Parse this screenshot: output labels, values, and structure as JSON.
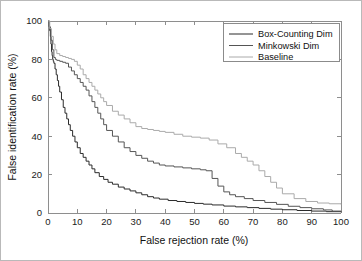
{
  "chart_data": {
    "type": "line",
    "title": "",
    "xlabel": "False rejection rate (%)",
    "ylabel": "False identification rate (%)",
    "xlim": [
      0,
      100
    ],
    "ylim": [
      0,
      100
    ],
    "xticks": [
      0,
      10,
      20,
      30,
      40,
      50,
      60,
      70,
      80,
      90,
      100
    ],
    "yticks": [
      0,
      20,
      40,
      60,
      80,
      100
    ],
    "xticklabels": [
      "0",
      "10",
      "20",
      "30",
      "40",
      "50",
      "60",
      "70",
      "80",
      "90",
      "100"
    ],
    "yticklabels": [
      "0",
      "20",
      "40",
      "60",
      "80",
      "100"
    ],
    "grid": false,
    "legend_position": "upper right",
    "series": [
      {
        "name": "Box-Counting Dim",
        "color": "#2b2b2b",
        "x": [
          0,
          0.4,
          0.8,
          1.0,
          1.2,
          1.4,
          1.6,
          1.8,
          2.0,
          2.4,
          2.8,
          3.2,
          3.6,
          4.0,
          4.6,
          5.2,
          5.8,
          6.4,
          7.0,
          7.6,
          8.4,
          9.2,
          10.0,
          11.0,
          12.0,
          13.0,
          14.0,
          15.0,
          16.0,
          17.5,
          19.0,
          20.5,
          22.0,
          24.0,
          26.0,
          28.0,
          30.0,
          32.0,
          34.0,
          36.0,
          38.0,
          41.0,
          44.0,
          47.0,
          50.0,
          53.0,
          56.0,
          60.0,
          64.0,
          68.0,
          72.0,
          76.0,
          80.0,
          85.0,
          90.0,
          95.0,
          100.0
        ],
        "y": [
          100,
          97,
          92,
          88,
          84,
          82,
          80,
          79,
          78,
          75,
          72,
          69,
          66,
          63,
          59,
          55,
          52,
          49,
          46,
          43,
          40,
          37,
          34,
          31,
          29,
          27,
          25,
          23,
          21,
          19,
          17.5,
          16,
          15,
          13.5,
          12.5,
          11.5,
          10.5,
          9.5,
          8.5,
          7.8,
          7.2,
          6.5,
          6.0,
          5.5,
          5.0,
          4.6,
          4.2,
          3.6,
          3.2,
          2.8,
          2.4,
          2.0,
          1.7,
          1.3,
          1.0,
          0.7,
          0.4
        ]
      },
      {
        "name": "Minkowski Dim",
        "color": "#555555",
        "x": [
          0,
          0.5,
          1.0,
          1.5,
          2.0,
          2.5,
          3.0,
          4.0,
          5.0,
          6.0,
          7.0,
          8.0,
          9.0,
          10.0,
          11.0,
          12.0,
          13.0,
          14.0,
          15.0,
          16.0,
          17.0,
          18.0,
          19.0,
          20.0,
          22.0,
          24.0,
          26.0,
          28.0,
          30.0,
          32.0,
          34.0,
          36.0,
          38.0,
          40.0,
          43.0,
          46.0,
          49.0,
          52.0,
          54.0,
          56.0,
          58.0,
          60.0,
          62.0,
          64.0,
          67.0,
          70.0,
          74.0,
          78.0,
          82.0,
          86.0,
          90.0,
          94.0,
          97.0,
          100.0
        ],
        "y": [
          100,
          95,
          90,
          85,
          81,
          80,
          79.5,
          79,
          78.5,
          78,
          76,
          74,
          72,
          70,
          68,
          66,
          64,
          61,
          58,
          55,
          52,
          49,
          46,
          43,
          40,
          37,
          34,
          32,
          30,
          28.5,
          27,
          26,
          25,
          24.5,
          24,
          23.5,
          23,
          22.5,
          22,
          18,
          14,
          11,
          9.5,
          8.5,
          7.5,
          6.5,
          5.5,
          4.5,
          3.5,
          2.8,
          2.2,
          1.6,
          1.0,
          0.5
        ]
      },
      {
        "name": "Baseline",
        "color": "#aaaaaa",
        "x": [
          0,
          0.6,
          1.2,
          1.8,
          2.4,
          3.0,
          4.0,
          5.0,
          6.0,
          7.0,
          8.0,
          9.0,
          10.0,
          11.0,
          12.0,
          13.0,
          14.0,
          15.0,
          16.0,
          17.0,
          18.0,
          19.0,
          20.0,
          22.0,
          24.0,
          26.0,
          28.0,
          30.0,
          32.0,
          34.0,
          36.0,
          38.0,
          40.0,
          43.0,
          46.0,
          49.0,
          52.0,
          55.0,
          58.0,
          61.0,
          64.0,
          66.0,
          68.0,
          70.0,
          72.0,
          74.0,
          76.0,
          78.0,
          80.0,
          84.0,
          88.0,
          92.0,
          96.0,
          100.0
        ],
        "y": [
          100,
          96,
          92,
          88,
          85,
          83,
          82,
          81.5,
          81,
          80.5,
          80,
          79,
          77,
          75,
          72,
          70,
          68,
          66,
          64,
          62,
          60,
          58,
          56,
          53,
          51,
          49,
          47,
          45,
          44,
          43.5,
          43,
          42.5,
          42,
          41,
          40,
          39.5,
          39,
          38,
          36,
          34,
          31,
          29,
          27,
          25,
          22,
          19,
          16,
          13,
          10,
          7.5,
          6,
          5.2,
          4.8,
          4.5
        ]
      }
    ]
  },
  "axes": {
    "xlabel": "False rejection rate (%)",
    "ylabel": "False identification rate (%)"
  },
  "legend": {
    "entries": [
      {
        "label": "Box-Counting Dim"
      },
      {
        "label": "Minkowski Dim"
      },
      {
        "label": "Baseline"
      }
    ]
  }
}
